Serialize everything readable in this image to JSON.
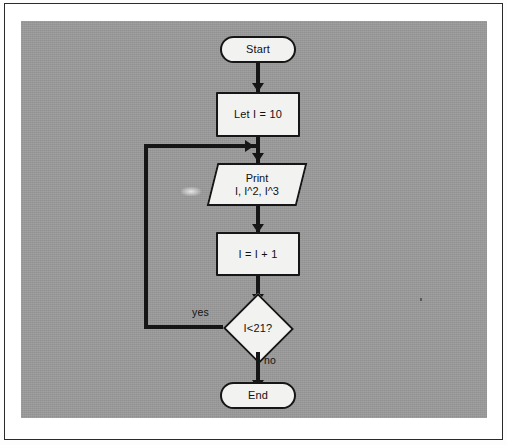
{
  "diagram": {
    "type": "flowchart",
    "nodes": [
      {
        "id": "start",
        "shape": "terminator",
        "label": "Start"
      },
      {
        "id": "init",
        "shape": "process",
        "label": "Let I = 10"
      },
      {
        "id": "print",
        "shape": "io",
        "line1": "Print",
        "line2": "I, I^2, I^3"
      },
      {
        "id": "increment",
        "shape": "process",
        "label": "I = I + 1"
      },
      {
        "id": "decision",
        "shape": "decision",
        "label": "I<21?"
      },
      {
        "id": "end",
        "shape": "terminator",
        "label": "End"
      }
    ],
    "edges": [
      {
        "from": "start",
        "to": "init",
        "label": ""
      },
      {
        "from": "init",
        "to": "print",
        "label": ""
      },
      {
        "from": "print",
        "to": "increment",
        "label": ""
      },
      {
        "from": "increment",
        "to": "decision",
        "label": ""
      },
      {
        "from": "decision",
        "to": "print",
        "label": "yes"
      },
      {
        "from": "decision",
        "to": "end",
        "label": "no"
      }
    ],
    "edge_labels": {
      "yes": "yes",
      "no": "no"
    },
    "colors": {
      "canvas_background": "#9a9a9a",
      "node_fill": "#f2f2f0",
      "stroke": "#161616",
      "page_background": "#ffffff",
      "text": "#111111"
    }
  }
}
